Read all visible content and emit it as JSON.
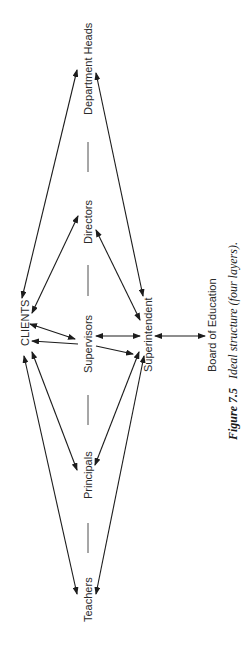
{
  "diagram": {
    "orientation": "rotated-90-ccw",
    "nodes": {
      "clients": "CLIENTS",
      "department_heads": "Department Heads",
      "directors": "Directors",
      "supervisors": "Supervisors",
      "principals": "Principals",
      "teachers": "Teachers",
      "superintendent": "Superintendent",
      "board": "Board of Education"
    },
    "separator": "—",
    "edges": [
      {
        "from": "CLIENTS",
        "to": "Department Heads",
        "type": "bidirectional"
      },
      {
        "from": "Superintendent",
        "to": "Department Heads",
        "type": "bidirectional"
      },
      {
        "from": "CLIENTS",
        "to": "Directors",
        "type": "bidirectional"
      },
      {
        "from": "Superintendent",
        "to": "Directors",
        "type": "bidirectional"
      },
      {
        "from": "Supervisors",
        "to": "CLIENTS",
        "type": "directed"
      },
      {
        "from": "Supervisors",
        "to": "CLIENTS",
        "type": "directed"
      },
      {
        "from": "Supervisors",
        "to": "Superintendent",
        "type": "bidirectional"
      },
      {
        "from": "Supervisors",
        "to": "Superintendent",
        "type": "directed"
      },
      {
        "from": "Superintendent",
        "to": "Board of Education",
        "type": "bidirectional"
      },
      {
        "from": "CLIENTS",
        "to": "Principals",
        "type": "bidirectional"
      },
      {
        "from": "Superintendent",
        "to": "Principals",
        "type": "bidirectional"
      },
      {
        "from": "CLIENTS",
        "to": "Teachers",
        "type": "bidirectional"
      },
      {
        "from": "Superintendent",
        "to": "Teachers",
        "type": "bidirectional"
      }
    ]
  },
  "caption": {
    "label": "Figure 7.5",
    "text": "Ideal structure (four layers)."
  }
}
